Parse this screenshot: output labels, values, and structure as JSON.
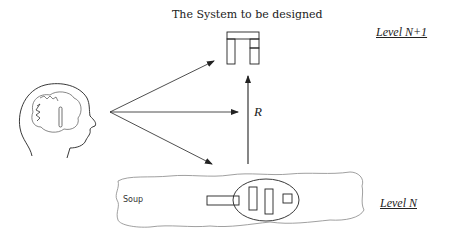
{
  "diagram": {
    "title": "The System to be designed",
    "levels": {
      "upper": "Level N+1",
      "lower": "Level N"
    },
    "relation_label": "R",
    "soup_label": "Soup",
    "elements": {
      "designer": "head-with-thoughts-icon",
      "system": "system-block-icon",
      "soup_region": "cloud-shape",
      "component_group": "ellipse-with-components"
    },
    "arrows": [
      {
        "from": "designer",
        "to": "system",
        "label": ""
      },
      {
        "from": "designer",
        "to": "relation",
        "label": ""
      },
      {
        "from": "designer",
        "to": "soup",
        "label": ""
      },
      {
        "from": "soup",
        "to": "system",
        "label": "R"
      }
    ],
    "colors": {
      "stroke": "#222222",
      "soup_stroke": "#888888",
      "background": "#ffffff"
    }
  }
}
